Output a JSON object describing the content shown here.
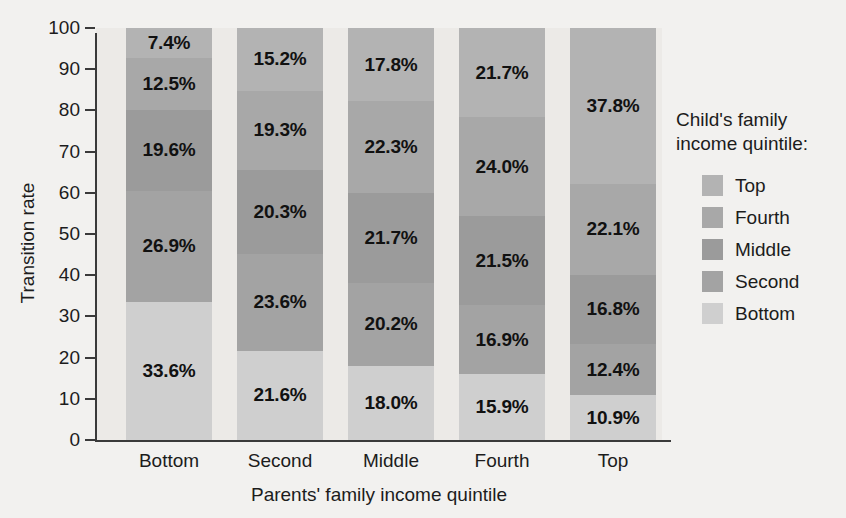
{
  "chart_data": {
    "type": "bar",
    "stacked": true,
    "title": "",
    "xlabel": "Parents' family income quintile",
    "ylabel": "Transition rate",
    "categories": [
      "Bottom",
      "Second",
      "Middle",
      "Fourth",
      "Top"
    ],
    "ylim": [
      0,
      100
    ],
    "yticks": [
      0,
      10,
      20,
      30,
      40,
      50,
      60,
      70,
      80,
      90,
      100
    ],
    "ytick_labels": [
      "0",
      "10",
      "20",
      "30",
      "40",
      "50",
      "60",
      "70",
      "80",
      "90",
      "100"
    ],
    "grid": false,
    "legend_position": "right",
    "legend_title": "Child's family income quintile:",
    "series": [
      {
        "name": "Top",
        "color": "#b3b3b3",
        "values": [
          7.4,
          15.2,
          17.8,
          21.7,
          37.8
        ],
        "labels": [
          "7.4%",
          "15.2%",
          "17.8%",
          "21.7%",
          "37.8%"
        ]
      },
      {
        "name": "Fourth",
        "color": "#a8a8a8",
        "values": [
          12.5,
          19.3,
          22.3,
          24.0,
          22.1
        ],
        "labels": [
          "12.5%",
          "19.3%",
          "22.3%",
          "24.0%",
          "22.1%"
        ]
      },
      {
        "name": "Middle",
        "color": "#9b9b9b",
        "values": [
          19.6,
          20.3,
          21.7,
          21.5,
          16.8
        ],
        "labels": [
          "19.6%",
          "20.3%",
          "21.7%",
          "21.5%",
          "16.8%"
        ]
      },
      {
        "name": "Second",
        "color": "#a3a3a3",
        "values": [
          26.9,
          23.6,
          20.2,
          16.9,
          12.4
        ],
        "labels": [
          "26.9%",
          "23.6%",
          "20.2%",
          "16.9%",
          "12.4%"
        ]
      },
      {
        "name": "Bottom",
        "color": "#cfcfcf",
        "values": [
          33.6,
          21.6,
          18.0,
          15.9,
          10.9
        ],
        "labels": [
          "33.6%",
          "21.6%",
          "18.0%",
          "15.9%",
          "10.9%"
        ]
      }
    ]
  },
  "legend": {
    "title_line1": "Child's family",
    "title_line2": "income quintile:",
    "items": [
      {
        "label": "Top",
        "color": "#b3b3b3"
      },
      {
        "label": "Fourth",
        "color": "#a8a8a8"
      },
      {
        "label": "Middle",
        "color": "#9b9b9b"
      },
      {
        "label": "Second",
        "color": "#a3a3a3"
      },
      {
        "label": "Bottom",
        "color": "#cfcfcf"
      }
    ]
  },
  "axes": {
    "y_title": "Transition rate",
    "x_title": "Parents' family income quintile"
  }
}
